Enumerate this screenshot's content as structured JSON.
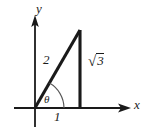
{
  "figure": {
    "type": "right-triangle-diagram",
    "background_color": "#ffffff",
    "stroke_color": "#1a1a1a",
    "axes": {
      "x_axis_label": "x",
      "y_axis_label": "y",
      "origin": {
        "x": 35,
        "y": 108
      }
    },
    "triangle": {
      "vertices": {
        "origin": {
          "x": 35,
          "y": 108
        },
        "base_end": {
          "x": 80,
          "y": 108
        },
        "apex": {
          "x": 80,
          "y": 30
        }
      },
      "hypotenuse_label": "2",
      "adjacent_label": "1",
      "opposite_label_sign": "√",
      "opposite_label_radicand": "3",
      "opposite_label_full": "√3",
      "angle_label": "θ"
    }
  }
}
